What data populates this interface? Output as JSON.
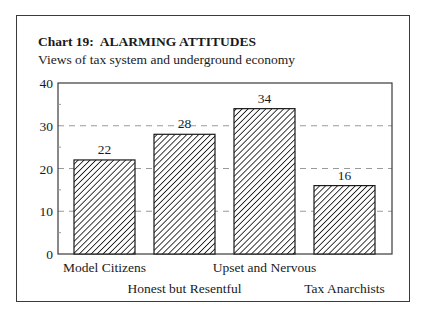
{
  "header": {
    "title": "Chart 19:  ALARMING ATTITUDES",
    "subtitle": "Views of tax system and underground economy"
  },
  "chart_data": {
    "type": "bar",
    "title": "Chart 19:  ALARMING ATTITUDES",
    "subtitle": "Views of tax system and underground economy",
    "categories": [
      "Model Citizens",
      "Honest but Resentful",
      "Upset and Nervous",
      "Tax Anarchists"
    ],
    "values": [
      22,
      28,
      34,
      16
    ],
    "value_labels": [
      "22",
      "28",
      "34",
      "16"
    ],
    "xlabel": "",
    "ylabel": "",
    "ylim": [
      0,
      40
    ],
    "yticks": [
      0,
      10,
      20,
      30,
      40
    ],
    "ytick_labels": [
      "0",
      "10",
      "20",
      "30",
      "40"
    ],
    "minor_yticks": [
      5,
      15,
      25,
      35
    ],
    "grid": "horizontal dashed at 10, 20, 30",
    "legend": "none",
    "bar_fill": "diagonal hatch",
    "x_label_layout": "staggered two rows"
  },
  "colors": {
    "ink": "#1a1a1a",
    "grid": "#9a9a9a",
    "background": "#ffffff"
  }
}
